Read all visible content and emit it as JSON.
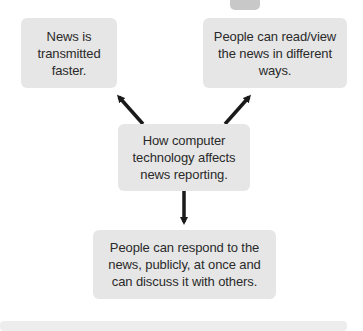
{
  "diagram": {
    "center": {
      "text": "How computer technology affects news reporting."
    },
    "effects": [
      {
        "text": "News is transmitted faster."
      },
      {
        "text": "People can read/view the news in different ways."
      },
      {
        "text": "People can respond to the news, publicly, at once and can discuss it with others."
      }
    ]
  },
  "colors": {
    "box_fill": "#e6e6e6",
    "arrow": "#1a1a1a",
    "text": "#2a2a2a"
  }
}
